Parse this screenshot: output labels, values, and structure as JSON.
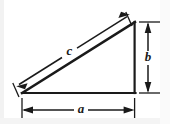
{
  "figure": {
    "background_color": "#ffffff",
    "line_color": "#1a1a1a",
    "edge_tint_color": "#e8e8e8",
    "labels": {
      "hypotenuse": "c",
      "vertical_leg": "b",
      "horizontal_leg": "a"
    },
    "geometry": {
      "vertex_left": [
        22,
        93
      ],
      "vertex_bottom_right": [
        135,
        93
      ],
      "vertex_top_right": [
        135,
        22
      ]
    },
    "dimensions": [
      {
        "name": "a",
        "label": "a",
        "orientation": "horizontal",
        "placement": "below",
        "arrowheads": "both-ends",
        "extension_lines": 2
      },
      {
        "name": "b",
        "label": "b",
        "orientation": "vertical",
        "placement": "right",
        "arrowheads": "both-ends",
        "extension_lines": 2
      },
      {
        "name": "c",
        "label": "c",
        "orientation": "diagonal",
        "placement": "above-hypotenuse",
        "arrowheads": "both-ends",
        "extension_lines": 2
      }
    ]
  }
}
